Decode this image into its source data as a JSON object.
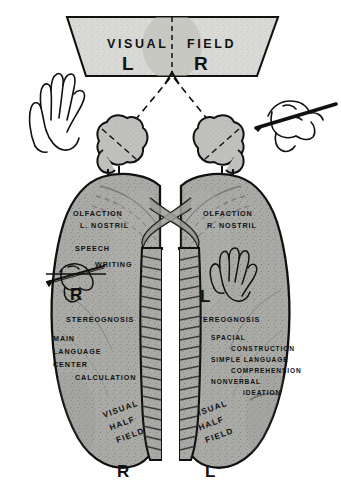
{
  "figure": {
    "title_top": "VISUAL FIELD",
    "visual_field": {
      "word_left": "VISUAL",
      "word_right": "FIELD",
      "half_left_letter": "L",
      "half_right_letter": "R"
    },
    "hands": {
      "left_icon": "open-hand-icon",
      "right_icon": "hand-holding-pencil-icon"
    },
    "eyes": {
      "left_icon": "left-eye-icon",
      "right_icon": "right-eye-icon",
      "chiasm_icon": "optic-chiasm-icon"
    },
    "left_hemisphere": {
      "olfaction_line1": "OLFACTION",
      "olfaction_line2": "L. NOSTRIL",
      "speech": "SPEECH",
      "writing": "WRITING",
      "hand_letter": "R",
      "hand_icon": "writing-hand-icon",
      "stereognosis": "STEREOGNOSIS",
      "functions": [
        "MAIN",
        "LANGUAGE",
        "CENTER",
        "CALCULATION"
      ],
      "visual_half_field": [
        "VISUAL",
        "HALF",
        "FIELD"
      ],
      "visual_half_field_letter": "R"
    },
    "right_hemisphere": {
      "olfaction_line1": "OLFACTION",
      "olfaction_line2": "R. NOSTRIL",
      "hand_letter": "L",
      "hand_icon": "open-hand-icon",
      "stereognosis": "STEREOGNOSIS",
      "functions": [
        "SPACIAL",
        "CONSTRUCTION",
        "SIMPLE LANGUAGE",
        "COMPREHENSION",
        "NONVERBAL",
        "IDEATION"
      ],
      "visual_half_field": [
        "VISUAL",
        "HALF",
        "FIELD"
      ],
      "visual_half_field_letter": "L"
    },
    "colors": {
      "ink": "#111111",
      "brain_fill": "#a9a9a6",
      "eye_fill": "#bdbdba",
      "field_fill": "#d8d8d5",
      "background": "#ffffff"
    }
  }
}
